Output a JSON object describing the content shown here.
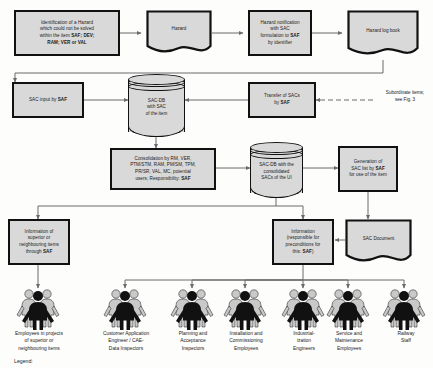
{
  "diagram": {
    "legend_label": "Legend:",
    "side_note": "Subordinate items;\nsee Fig. 3",
    "colors": {
      "node_fill": "#d9d9d9",
      "node_border": "#111111",
      "wire": "#6b6b6b",
      "person_dark": "#111111",
      "person_light": "#c9c9c9",
      "page_bg": "#fdfdfc"
    },
    "nodes": [
      {
        "id": "identification",
        "name": "identification-of-hazard-box",
        "shape": "process",
        "text": "Identification of a Hazard which could not be solved within the item SAF; DEV; RAM; VER or VAL",
        "lines": [
          "Identification of a Hazard",
          "which could not be solved",
          "within the item SAF; DEV;",
          "RAM; VER or VAL"
        ]
      },
      {
        "id": "hazard",
        "name": "hazard-document",
        "shape": "document",
        "text": "Hazard",
        "lines": [
          "Hazard"
        ]
      },
      {
        "id": "hazard_notification",
        "name": "hazard-notification-box",
        "shape": "process",
        "text": "Hazard notification with SAC formulation to SAF by identifier",
        "lines": [
          "Hazard notification",
          "with SAC",
          "formulation to SAF",
          "by identifier"
        ]
      },
      {
        "id": "hazard_log_book",
        "name": "hazard-log-book-document",
        "shape": "document",
        "text": "Hazard log book",
        "lines": [
          "Hazard log book"
        ]
      },
      {
        "id": "sac_input",
        "name": "sac-input-by-saf-box",
        "shape": "process",
        "text": "SAC input by SAF",
        "lines": [
          "SAC input by SAF"
        ]
      },
      {
        "id": "sac_db_item",
        "name": "sac-db-of-item-cylinder",
        "shape": "database",
        "text": "SAC-DB with SAC of the item",
        "lines": [
          "SAC-DB",
          "with SAC",
          "of the item"
        ]
      },
      {
        "id": "transfer_sacs",
        "name": "transfer-of-sacs-box",
        "shape": "process",
        "text": "Transfer of SACs by SAF",
        "lines": [
          "Transfer of SACs",
          "by SAF"
        ]
      },
      {
        "id": "consolidation",
        "name": "consolidation-box",
        "shape": "process",
        "text": "Consolidation by RM, VER, PTM/STM, RAM, PM/SM, TPM, PR/SR, VAL, MC, potential users; Responsibility: SAF",
        "lines": [
          "Consolidation by RM, VER,",
          "PTM/STM, RAM, PM/SM, TPM,",
          "PR/SR, VAL, MC, potential",
          "users; Responsibility: SAF"
        ]
      },
      {
        "id": "sac_db_ui",
        "name": "sac-db-consolidated-cylinder",
        "shape": "database",
        "text": "SAC-DB with the consolidated SACs of the UI",
        "lines": [
          "SAC-DB with the",
          "consolidated",
          "SACs of the UI"
        ]
      },
      {
        "id": "generation_sac_list",
        "name": "generation-of-sac-list-box",
        "shape": "process",
        "text": "Generation of SAC list by SAF for use of the item",
        "lines": [
          "Generation of",
          "SAC list  by SAF",
          "for use of the item"
        ]
      },
      {
        "id": "info_superior",
        "name": "information-superior-items-box",
        "shape": "process",
        "text": "Information of superior or neighbouring items through SAF",
        "lines": [
          "Information of",
          "superior or",
          "neighbouring items",
          "through SAF"
        ]
      },
      {
        "id": "info_preconditions",
        "name": "information-preconditions-box",
        "shape": "process",
        "text": "Information (responsible for preconditions for this: SAF)",
        "lines": [
          "Information",
          "(responsible for",
          "preconditions for",
          "this:  SAF)"
        ]
      },
      {
        "id": "sac_document",
        "name": "sac-document",
        "shape": "document",
        "text": "SAC Document",
        "lines": [
          "SAC Document"
        ]
      }
    ],
    "actors": [
      {
        "id": "employees_superior",
        "name": "actor-employees-superior-items",
        "lines": [
          "Employees in projects",
          "of superior or",
          "neighbouring items"
        ]
      },
      {
        "id": "customer_app_engineer",
        "name": "actor-customer-application-engineer",
        "lines": [
          "Customer Application",
          "Engineer / CAE-",
          "Data Inspectors"
        ]
      },
      {
        "id": "planning_acceptance",
        "name": "actor-planning-acceptance-inspectors",
        "lines": [
          "Planning and",
          "Acceptance",
          "Inspectors"
        ]
      },
      {
        "id": "installation_commissioning",
        "name": "actor-installation-commissioning-employees",
        "lines": [
          "Installation and",
          "Commissioning",
          "Employees"
        ]
      },
      {
        "id": "industrialization",
        "name": "actor-industrialization-engineers",
        "lines": [
          "Industrial-",
          "ization",
          "Engineers"
        ]
      },
      {
        "id": "service_maintenance",
        "name": "actor-service-maintenance-employees",
        "lines": [
          "Service and",
          "Maintenance",
          "Employees"
        ]
      },
      {
        "id": "railway_staff",
        "name": "actor-railway-staff",
        "lines": [
          "Railway",
          "Staff"
        ]
      }
    ]
  }
}
